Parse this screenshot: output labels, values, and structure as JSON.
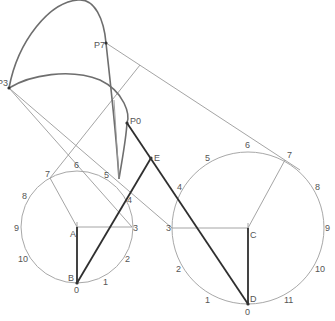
{
  "diagram": {
    "points": {
      "P0": {
        "label": "P0",
        "x": 127,
        "y": 123
      },
      "P3": {
        "label": "P3",
        "x": 9,
        "y": 88
      },
      "P7": {
        "label": "P7",
        "x": 106,
        "y": 43
      },
      "E": {
        "label": "E",
        "x": 151,
        "y": 158
      },
      "A": {
        "label": "A",
        "x": 77,
        "y": 227
      },
      "B": {
        "label": "B",
        "x": 77,
        "y": 283
      },
      "C": {
        "label": "C",
        "x": 248,
        "y": 228
      },
      "D": {
        "label": "D",
        "x": 248,
        "y": 304
      }
    },
    "left_circle": {
      "center": "A",
      "radius": 56,
      "divisions": [
        "0",
        "1",
        "2",
        "3",
        "4",
        "5",
        "6",
        "7",
        "8",
        "9",
        "10"
      ]
    },
    "right_circle": {
      "center": "C",
      "radius": 76,
      "divisions": [
        "0",
        "1",
        "2",
        "3",
        "4",
        "5",
        "6",
        "7",
        "8",
        "9",
        "10",
        "11"
      ]
    },
    "labels": {
      "P0": "P0",
      "P3": "P3",
      "P7": "P7",
      "E": "E",
      "A": "A",
      "B": "B",
      "C": "C",
      "D": "D"
    },
    "colors": {
      "construction": "#9a9a9a",
      "curve": "#6e6e6e",
      "linkage": "#2f2f2f"
    }
  }
}
